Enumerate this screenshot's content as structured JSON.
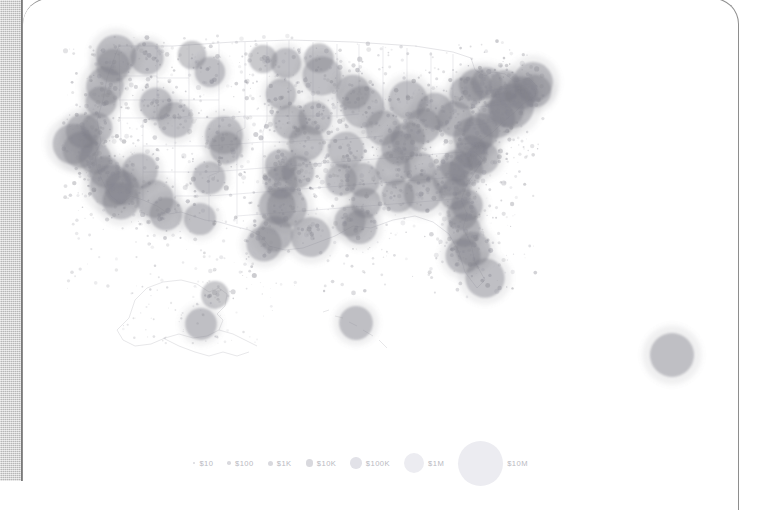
{
  "panel": {
    "title": "US spending bubble map",
    "background_color": "#ffffff",
    "gutter_color": "#c9c9c9",
    "border_color": "#8e8e8e"
  },
  "legend": {
    "name": "bubble-size-legend",
    "items": [
      {
        "label": "$10",
        "value": 10,
        "diameter_px": 2.4
      },
      {
        "label": "$100",
        "value": 100,
        "diameter_px": 3.6
      },
      {
        "label": "$1K",
        "value": 1000,
        "diameter_px": 5.0
      },
      {
        "label": "$10K",
        "value": 10000,
        "diameter_px": 7.2
      },
      {
        "label": "$100K",
        "value": 100000,
        "diameter_px": 11.5
      },
      {
        "label": "$1M",
        "value": 1000000,
        "diameter_px": 20.0
      },
      {
        "label": "$10M",
        "value": 10000000,
        "diameter_px": 45.0
      }
    ]
  },
  "chart_data": {
    "type": "scatter",
    "title": "",
    "xlabel": "",
    "ylabel": "",
    "projection": "albers-usa",
    "grid": false,
    "legend_position": "bottom-center",
    "marker": {
      "shape": "circle",
      "fill": "#7b7b85",
      "opacity": 0.45,
      "scale": "log-area",
      "value_unit": "USD"
    },
    "outline": {
      "states_stroke": "#d8d8dc",
      "nation_stroke": "#cfcfd4",
      "stroke_width": 0.6
    },
    "series": [
      {
        "name": "Spending by place",
        "points": [
          {
            "label": "Seattle",
            "x": 93,
            "y": 55,
            "value": 3200000
          },
          {
            "label": "Tacoma",
            "x": 90,
            "y": 66,
            "value": 420000
          },
          {
            "label": "Spokane",
            "x": 124,
            "y": 58,
            "value": 380000
          },
          {
            "label": "Portland",
            "x": 82,
            "y": 86,
            "value": 1400000
          },
          {
            "label": "Eugene",
            "x": 78,
            "y": 102,
            "value": 190000
          },
          {
            "label": "Boise",
            "x": 133,
            "y": 104,
            "value": 330000
          },
          {
            "label": "Billings",
            "x": 187,
            "y": 72,
            "value": 150000
          },
          {
            "label": "Great Falls",
            "x": 169,
            "y": 55,
            "value": 90000
          },
          {
            "label": "Bismarck",
            "x": 240,
            "y": 59,
            "value": 85000
          },
          {
            "label": "Fargo",
            "x": 263,
            "y": 63,
            "value": 140000
          },
          {
            "label": "Minneapolis",
            "x": 299,
            "y": 76,
            "value": 2100000
          },
          {
            "label": "Duluth",
            "x": 296,
            "y": 58,
            "value": 120000
          },
          {
            "label": "Sioux Falls",
            "x": 258,
            "y": 94,
            "value": 160000
          },
          {
            "label": "Omaha",
            "x": 267,
            "y": 122,
            "value": 430000
          },
          {
            "label": "Des Moines",
            "x": 292,
            "y": 118,
            "value": 380000
          },
          {
            "label": "Kansas City",
            "x": 283,
            "y": 143,
            "value": 760000
          },
          {
            "label": "Wichita",
            "x": 258,
            "y": 165,
            "value": 260000
          },
          {
            "label": "St. Louis",
            "x": 323,
            "y": 150,
            "value": 980000
          },
          {
            "label": "Chicago",
            "x": 340,
            "y": 107,
            "value": 5400000
          },
          {
            "label": "Milwaukee",
            "x": 330,
            "y": 92,
            "value": 520000
          },
          {
            "label": "Indianapolis",
            "x": 360,
            "y": 128,
            "value": 610000
          },
          {
            "label": "Detroit",
            "x": 385,
            "y": 100,
            "value": 1900000
          },
          {
            "label": "Cleveland",
            "x": 412,
            "y": 111,
            "value": 940000
          },
          {
            "label": "Columbus",
            "x": 400,
            "y": 126,
            "value": 620000
          },
          {
            "label": "Cincinnati",
            "x": 385,
            "y": 139,
            "value": 480000
          },
          {
            "label": "Pittsburgh",
            "x": 432,
            "y": 119,
            "value": 720000
          },
          {
            "label": "Buffalo",
            "x": 443,
            "y": 93,
            "value": 330000
          },
          {
            "label": "Rochester",
            "x": 452,
            "y": 85,
            "value": 260000
          },
          {
            "label": "Syracuse",
            "x": 464,
            "y": 83,
            "value": 210000
          },
          {
            "label": "Albany",
            "x": 482,
            "y": 86,
            "value": 240000
          },
          {
            "label": "Boston",
            "x": 510,
            "y": 82,
            "value": 2600000
          },
          {
            "label": "Providence",
            "x": 512,
            "y": 91,
            "value": 300000
          },
          {
            "label": "Hartford",
            "x": 498,
            "y": 93,
            "value": 330000
          },
          {
            "label": "New York",
            "x": 489,
            "y": 106,
            "value": 9800000
          },
          {
            "label": "Newark",
            "x": 483,
            "y": 109,
            "value": 900000
          },
          {
            "label": "Philadelphia",
            "x": 473,
            "y": 119,
            "value": 1800000
          },
          {
            "label": "Baltimore",
            "x": 458,
            "y": 131,
            "value": 860000
          },
          {
            "label": "Washington DC",
            "x": 450,
            "y": 137,
            "value": 2400000
          },
          {
            "label": "Richmond",
            "x": 448,
            "y": 152,
            "value": 330000
          },
          {
            "label": "Norfolk",
            "x": 460,
            "y": 158,
            "value": 300000
          },
          {
            "label": "Raleigh",
            "x": 443,
            "y": 170,
            "value": 420000
          },
          {
            "label": "Charlotte",
            "x": 427,
            "y": 179,
            "value": 560000
          },
          {
            "label": "Greensboro",
            "x": 433,
            "y": 166,
            "value": 230000
          },
          {
            "label": "Columbia",
            "x": 432,
            "y": 194,
            "value": 210000
          },
          {
            "label": "Charleston SC",
            "x": 444,
            "y": 205,
            "value": 220000
          },
          {
            "label": "Savannah",
            "x": 439,
            "y": 215,
            "value": 160000
          },
          {
            "label": "Atlanta",
            "x": 400,
            "y": 193,
            "value": 1700000
          },
          {
            "label": "Birmingham",
            "x": 375,
            "y": 196,
            "value": 330000
          },
          {
            "label": "Nashville",
            "x": 370,
            "y": 168,
            "value": 560000
          },
          {
            "label": "Knoxville",
            "x": 397,
            "y": 168,
            "value": 230000
          },
          {
            "label": "Memphis",
            "x": 340,
            "y": 180,
            "value": 430000
          },
          {
            "label": "Louisville",
            "x": 375,
            "y": 148,
            "value": 390000
          },
          {
            "label": "Jacksonville",
            "x": 441,
            "y": 230,
            "value": 380000
          },
          {
            "label": "Orlando",
            "x": 450,
            "y": 249,
            "value": 560000
          },
          {
            "label": "Tampa",
            "x": 440,
            "y": 256,
            "value": 620000
          },
          {
            "label": "Miami",
            "x": 462,
            "y": 278,
            "value": 2300000
          },
          {
            "label": "New Orleans",
            "x": 337,
            "y": 227,
            "value": 480000
          },
          {
            "label": "Baton Rouge",
            "x": 327,
            "y": 221,
            "value": 200000
          },
          {
            "label": "Jackson",
            "x": 343,
            "y": 203,
            "value": 140000
          },
          {
            "label": "Little Rock",
            "x": 318,
            "y": 180,
            "value": 230000
          },
          {
            "label": "Oklahoma City",
            "x": 258,
            "y": 182,
            "value": 370000
          },
          {
            "label": "Tulsa",
            "x": 275,
            "y": 172,
            "value": 290000
          },
          {
            "label": "Dallas",
            "x": 264,
            "y": 207,
            "value": 3100000
          },
          {
            "label": "Fort Worth",
            "x": 254,
            "y": 206,
            "value": 1100000
          },
          {
            "label": "Austin",
            "x": 252,
            "y": 234,
            "value": 720000
          },
          {
            "label": "San Antonio",
            "x": 241,
            "y": 244,
            "value": 640000
          },
          {
            "label": "Houston",
            "x": 288,
            "y": 237,
            "value": 2700000
          },
          {
            "label": "El Paso",
            "x": 177,
            "y": 219,
            "value": 260000
          },
          {
            "label": "Albuquerque",
            "x": 186,
            "y": 178,
            "value": 330000
          },
          {
            "label": "Denver",
            "x": 201,
            "y": 135,
            "value": 1500000
          },
          {
            "label": "Colorado Sprgs",
            "x": 203,
            "y": 148,
            "value": 310000
          },
          {
            "label": "Salt Lake City",
            "x": 152,
            "y": 120,
            "value": 780000
          },
          {
            "label": "Las Vegas",
            "x": 117,
            "y": 171,
            "value": 760000
          },
          {
            "label": "Phoenix",
            "x": 132,
            "y": 199,
            "value": 1400000
          },
          {
            "label": "Tucson",
            "x": 143,
            "y": 214,
            "value": 330000
          },
          {
            "label": "San Diego",
            "x": 98,
            "y": 201,
            "value": 1100000
          },
          {
            "label": "Los Angeles",
            "x": 88,
            "y": 186,
            "value": 6200000
          },
          {
            "label": "Riverside",
            "x": 99,
            "y": 188,
            "value": 520000
          },
          {
            "label": "Bakersfield",
            "x": 82,
            "y": 172,
            "value": 200000
          },
          {
            "label": "Fresno",
            "x": 72,
            "y": 158,
            "value": 250000
          },
          {
            "label": "San Jose",
            "x": 58,
            "y": 150,
            "value": 900000
          },
          {
            "label": "San Francisco",
            "x": 50,
            "y": 144,
            "value": 3400000
          },
          {
            "label": "Sacramento",
            "x": 60,
            "y": 131,
            "value": 520000
          },
          {
            "label": "Reno",
            "x": 74,
            "y": 128,
            "value": 190000
          },
          {
            "label": "Anchorage",
            "x": 178,
            "y": 324,
            "value": 230000
          },
          {
            "label": "Fairbanks",
            "x": 192,
            "y": 295,
            "value": 70000
          },
          {
            "label": "Honolulu",
            "x": 333,
            "y": 323,
            "value": 430000
          },
          {
            "label": "Offshore/PR",
            "x": 649,
            "y": 355,
            "value": 9000000
          }
        ]
      }
    ]
  }
}
